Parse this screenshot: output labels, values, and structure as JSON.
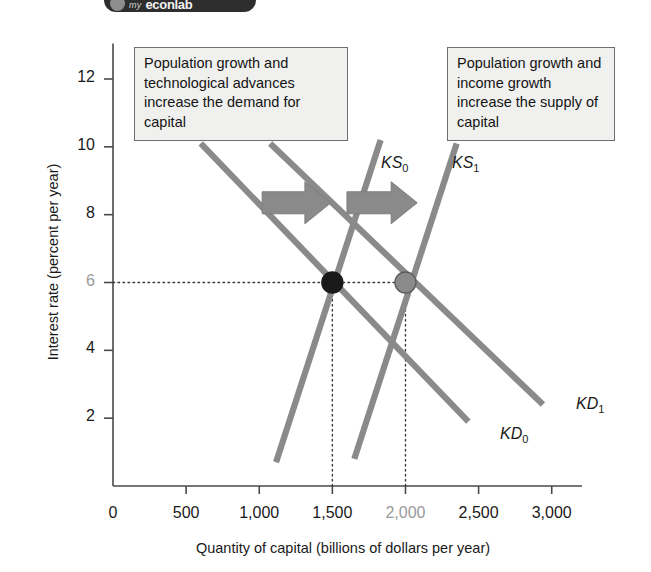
{
  "badge": {
    "mark": "magnifier-icon",
    "prefix": "my",
    "name": "econlab"
  },
  "chart_data": {
    "type": "line",
    "title": "",
    "xlabel": "Quantity of capital (billions of dollars per year)",
    "ylabel": "Interest rate (percent per year)",
    "xlim": [
      0,
      3125
    ],
    "ylim": [
      0,
      13
    ],
    "xticks": [
      0,
      500,
      1000,
      1500,
      2000,
      2500,
      3000
    ],
    "xticklabels": [
      "0",
      "500",
      "1,000",
      "1,500",
      "2,000",
      "2,500",
      "3,000"
    ],
    "yticks": [
      2,
      4,
      6,
      8,
      10,
      12
    ],
    "yticklabels": [
      "2",
      "4",
      "6",
      "8",
      "10",
      "12"
    ],
    "grid": false,
    "legend": "inline-curve-labels",
    "series": [
      {
        "name": "KD0",
        "label": "KD",
        "sub": "0",
        "role": "demand",
        "color": "#8a8a8a",
        "points": [
          [
            600,
            10.1
          ],
          [
            2430,
            1.9
          ]
        ]
      },
      {
        "name": "KD1",
        "label": "KD",
        "sub": "1",
        "role": "demand",
        "color": "#8a8a8a",
        "points": [
          [
            1075,
            10.1
          ],
          [
            2940,
            2.4
          ]
        ]
      },
      {
        "name": "KS0",
        "label": "KS",
        "sub": "0",
        "role": "supply",
        "color": "#8a8a8a",
        "points": [
          [
            1115,
            0.7
          ],
          [
            1830,
            10.2
          ]
        ]
      },
      {
        "name": "KS1",
        "label": "KS",
        "sub": "1",
        "role": "supply",
        "color": "#8a8a8a",
        "points": [
          [
            1650,
            0.8
          ],
          [
            2350,
            10.1
          ]
        ]
      }
    ],
    "equilibria": [
      {
        "name": "initial-equilibrium",
        "x": 1500,
        "y": 6,
        "color": "#1a1a1a"
      },
      {
        "name": "new-equilibrium",
        "x": 2000,
        "y": 6,
        "color": "#8a8a8a"
      }
    ],
    "guide_lines": [
      {
        "name": "interest-rate-guide",
        "type": "horizontal",
        "y": 6,
        "from_x": 0,
        "to_x": 2000
      },
      {
        "name": "quantity-guide-1500",
        "type": "vertical",
        "x": 1500,
        "from_y": 0,
        "to_y": 6
      },
      {
        "name": "quantity-guide-2000",
        "type": "vertical",
        "x": 2000,
        "from_y": 0,
        "to_y": 6
      }
    ],
    "shift_arrows": [
      {
        "name": "demand-shift-arrow",
        "direction": "right",
        "from_x": 1020,
        "to_x": 1490,
        "y": 8.35
      },
      {
        "name": "supply-shift-arrow",
        "direction": "right",
        "from_x": 1600,
        "to_x": 2080,
        "y": 8.35
      }
    ],
    "annotations": [
      {
        "name": "demand-shift-note",
        "text": "Population growth and technological advances increase the demand for capital"
      },
      {
        "name": "supply-shift-note",
        "text": "Population growth and income growth increase the supply of capital"
      }
    ]
  },
  "notes": {
    "left": "Population growth and technological advances increase the demand for capital",
    "right": "Population growth and income growth increase the supply of capital"
  },
  "colors": {
    "curve": "#8a8a8a",
    "axis": "#4a4a4a",
    "dot_initial": "#1a1a1a",
    "dot_new": "#8a8a8a",
    "note_bg": "#f0f0ee",
    "note_border": "#6e6e6e",
    "text": "#1a1a1a",
    "dim_text": "#9a9a9a"
  }
}
